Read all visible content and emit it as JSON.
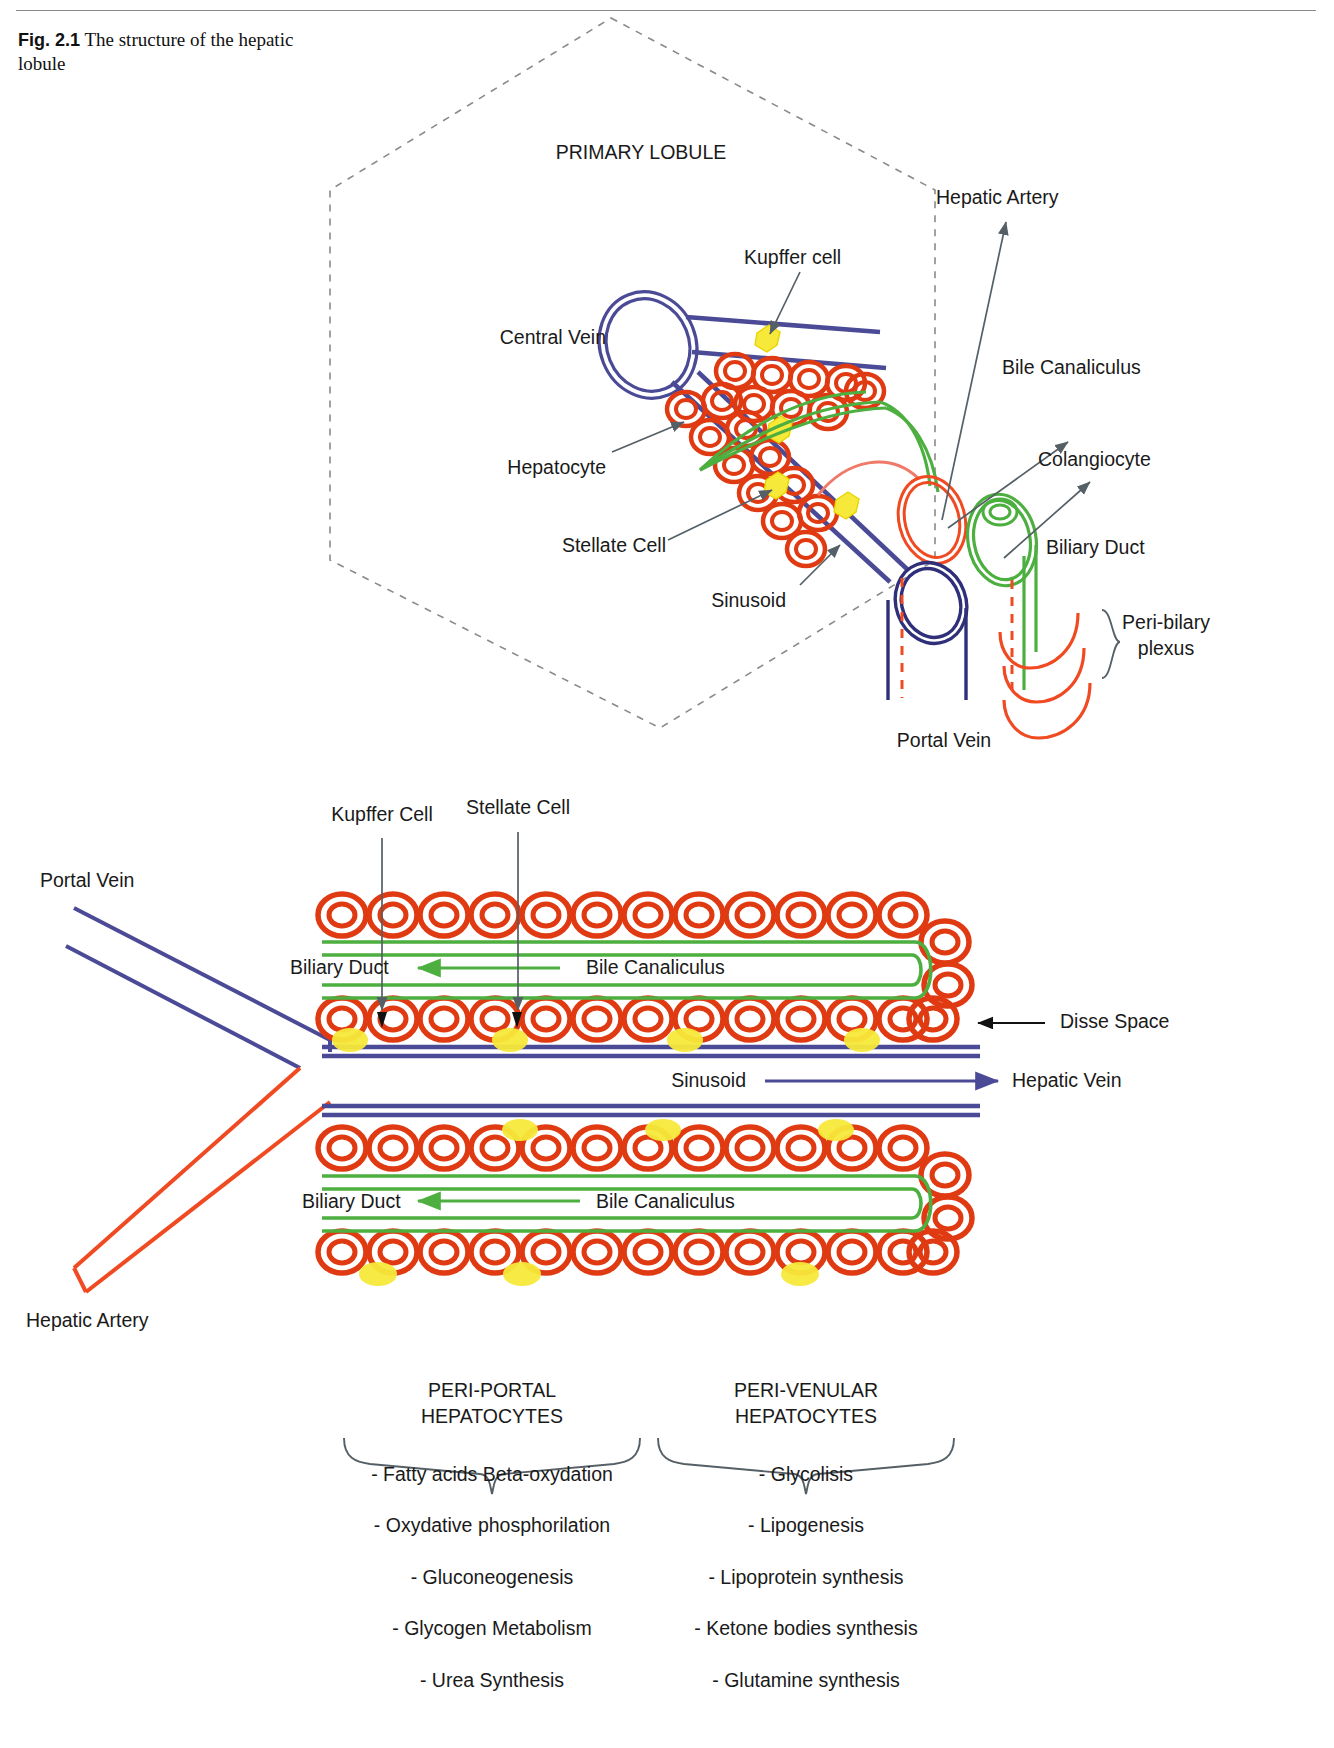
{
  "figure": {
    "number": "Fig. 2.1",
    "caption": "The structure of the hepatic lobule"
  },
  "colors": {
    "hepatocyte": "#e03a12",
    "hepatocyte_inner": "#f07a22",
    "vein_blue": "#4a4a96",
    "bile_green": "#4caf3f",
    "artery_red": "#f04a22",
    "stellate_yellow": "#f7e93a",
    "leader": "#555f66",
    "dashed_outline": "#777777"
  },
  "top_panel": {
    "title": "PRIMARY LOBULE",
    "labels": {
      "kupffer_cell": "Kupffer cell",
      "hepatic_artery": "Hepatic Artery",
      "central_vein": "Central Vein",
      "bile_canaliculus": "Bile Canaliculus",
      "colangiocyte": "Colangiocyte",
      "hepatocyte": "Hepatocyte",
      "biliary_duct": "Biliary Duct",
      "stellate_cell": "Stellate Cell",
      "sinusoid": "Sinusoid",
      "peri_bilary_plexus": "Peri-bilary\nplexus",
      "portal_vein": "Portal Vein"
    }
  },
  "bottom_panel": {
    "labels": {
      "kupffer_cell": "Kupffer Cell",
      "stellate_cell": "Stellate Cell",
      "portal_vein": "Portal Vein",
      "biliary_duct_upper": "Biliary Duct",
      "bile_canaliculus_upper": "Bile Canaliculus",
      "disse_space": "Disse Space",
      "sinusoid": "Sinusoid",
      "hepatic_vein": "Hepatic Vein",
      "biliary_duct_lower": "Biliary Duct",
      "bile_canaliculus_lower": "Bile Canaliculus",
      "hepatic_artery": "Hepatic Artery"
    },
    "zones": [
      {
        "id": "peri-portal",
        "title": "PERI-PORTAL\nHEPATOCYTES",
        "functions": [
          "- Fatty acids Beta-oxydation",
          "- Oxydative phosphorilation",
          "- Gluconeogenesis",
          "- Glycogen Metabolism",
          "- Urea Synthesis"
        ]
      },
      {
        "id": "peri-venular",
        "title": "PERI-VENULAR\nHEPATOCYTES",
        "functions": [
          "- Glycolisis",
          "- Lipogenesis",
          "- Lipoprotein synthesis",
          "- Ketone bodies synthesis",
          "- Glutamine synthesis"
        ]
      }
    ]
  }
}
